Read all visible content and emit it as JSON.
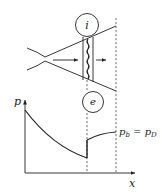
{
  "diagram": {
    "labels": {
      "upstream_state": "i",
      "downstream_state": "e",
      "y_axis": "p",
      "x_axis": "x",
      "exit_pressure_eq_lhs": "p",
      "exit_pressure_eq_lhs_sub": "b",
      "exit_pressure_eq_sign": " = ",
      "exit_pressure_eq_rhs": "p",
      "exit_pressure_eq_rhs_sub": "D"
    },
    "colors": {
      "ink": "#222222",
      "background": "#ffffff"
    }
  }
}
